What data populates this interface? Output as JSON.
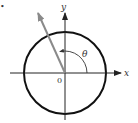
{
  "diagram": {
    "bullet": "•",
    "axes": {
      "x_label": "x",
      "y_label": "y",
      "origin_label": "0"
    },
    "angle_label": "θ",
    "colors": {
      "circle": "#111111",
      "axes": "#222222",
      "vector": "#8a8a8a",
      "arc": "#333333"
    }
  }
}
